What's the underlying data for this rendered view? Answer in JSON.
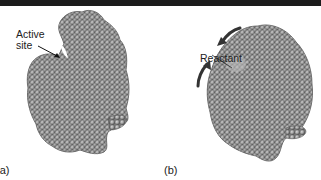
{
  "figure": {
    "panels": [
      {
        "id": "a",
        "panel_label": "(a)",
        "annotation": {
          "line1": "Active",
          "line2": "site"
        },
        "description": "Space-filling model of enzyme with open active site"
      },
      {
        "id": "b",
        "panel_label": "(b)",
        "annotation": {
          "line1": "Reactant"
        },
        "description": "Enzyme closed around bound reactant (induced fit), curved arrows show conformational change"
      }
    ],
    "colors": {
      "top_bar": "#1c1c1c",
      "atom_fill": "#9a9a9a",
      "atom_highlight": "#d4d4d4",
      "atom_shadow": "#4a4a4a",
      "text": "#222222"
    }
  }
}
